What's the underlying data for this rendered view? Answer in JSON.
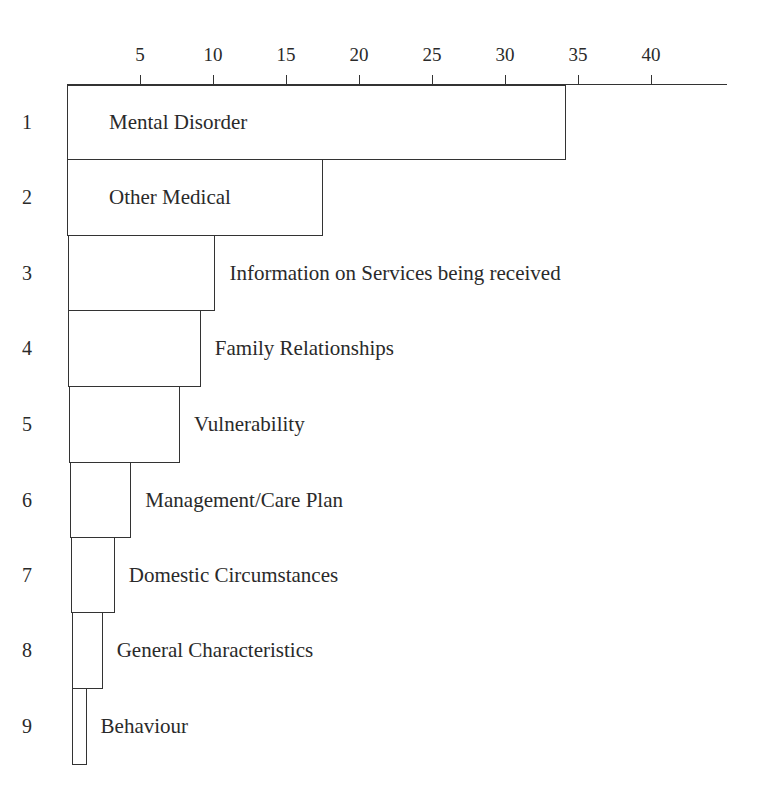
{
  "chart_data": {
    "type": "bar",
    "orientation": "horizontal",
    "title": "",
    "xlabel": "",
    "ylabel": "",
    "x_ticks": [
      5,
      10,
      15,
      20,
      25,
      30,
      35,
      40
    ],
    "xlim": [
      0,
      45
    ],
    "grid": false,
    "legend": null,
    "categories": [
      "1",
      "2",
      "3",
      "4",
      "5",
      "6",
      "7",
      "8",
      "9"
    ],
    "labels": [
      "Mental Disorder",
      "Other Medical",
      "Information on Services being received",
      "Family Relationships",
      "Vulnerability",
      "Management/Care Plan",
      "Domestic Circumstances",
      "General Characteristics",
      "Behaviour"
    ],
    "values": [
      34.2,
      17.5,
      10.1,
      9.1,
      7.6,
      4.2,
      3.0,
      2.1,
      1.0
    ],
    "label_inside": [
      true,
      true,
      false,
      false,
      false,
      false,
      false,
      false,
      false
    ]
  }
}
